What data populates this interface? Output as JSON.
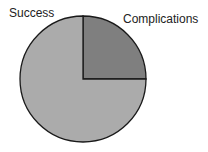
{
  "chart_data": {
    "type": "pie",
    "title": "",
    "categories": [
      "Success",
      "Complications"
    ],
    "values": [
      75,
      25
    ],
    "colors": [
      "#ababab",
      "#7f7f7f"
    ],
    "labels": [
      "Success",
      "Complications"
    ],
    "legend": "none",
    "start_angle_deg": 90,
    "direction": "clockwise"
  },
  "labels": {
    "success": "Success",
    "complications": "Complications"
  }
}
